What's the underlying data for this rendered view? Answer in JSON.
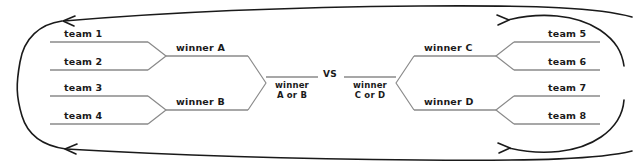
{
  "diagram": {
    "type": "tournament-bracket",
    "colors": {
      "text": "#1a1a1a",
      "match_line": "#8a8a8a",
      "bracket_line": "#707070",
      "flow_arrow": "#1a1a1a",
      "background": "#ffffff"
    },
    "vs_label": "VS",
    "left_half": {
      "round1": [
        {
          "id": "team-1",
          "label": "team 1"
        },
        {
          "id": "team-2",
          "label": "team 2"
        },
        {
          "id": "team-3",
          "label": "team 3"
        },
        {
          "id": "team-4",
          "label": "team 4"
        }
      ],
      "round2": [
        {
          "id": "winner-a",
          "label": "winner A",
          "from": [
            "team 1",
            "team 2"
          ]
        },
        {
          "id": "winner-b",
          "label": "winner B",
          "from": [
            "team 3",
            "team 4"
          ]
        }
      ],
      "final_slot": {
        "id": "winner-a-or-b",
        "line1": "winner",
        "line2": "A or B",
        "from": [
          "winner A",
          "winner B"
        ]
      }
    },
    "right_half": {
      "round1": [
        {
          "id": "team-5",
          "label": "team 5"
        },
        {
          "id": "team-6",
          "label": "team 6"
        },
        {
          "id": "team-7",
          "label": "team 7"
        },
        {
          "id": "team-8",
          "label": "team 8"
        }
      ],
      "round2": [
        {
          "id": "winner-c",
          "label": "winner C",
          "from": [
            "team 5",
            "team 6"
          ]
        },
        {
          "id": "winner-d",
          "label": "winner D",
          "from": [
            "team 7",
            "team 8"
          ]
        }
      ],
      "final_slot": {
        "id": "winner-c-or-d",
        "line1": "winner",
        "line2": "C or D",
        "from": [
          "winner C",
          "winner D"
        ]
      }
    },
    "wrap_arrows": [
      {
        "id": "wrap-top",
        "direction": "right-to-left"
      },
      {
        "id": "wrap-bottom",
        "direction": "right-to-left"
      }
    ]
  }
}
